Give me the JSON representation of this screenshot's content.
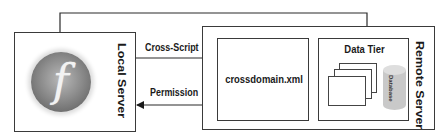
{
  "diagram": {
    "type": "architecture",
    "nodes": [
      {
        "id": "local_server",
        "label": "Local Server",
        "icon": "flash-player-icon"
      },
      {
        "id": "remote_server",
        "label": "Remote Server"
      },
      {
        "id": "crossdomain",
        "label": "crossdomain.xml",
        "parent": "remote_server"
      },
      {
        "id": "data_tier",
        "label": "Data Tier",
        "parent": "remote_server"
      },
      {
        "id": "database",
        "label": "Database",
        "parent": "data_tier"
      }
    ],
    "edges": [
      {
        "from": "local_server",
        "to": "crossdomain",
        "label": "Cross-Script"
      },
      {
        "from": "crossdomain",
        "to": "local_server",
        "label": "Permission"
      },
      {
        "from": "local_server",
        "to": "data_tier",
        "label": ""
      }
    ]
  },
  "local_server": {
    "label": "Local Server",
    "icon_glyph": "f"
  },
  "remote_server": {
    "label": "Remote Server"
  },
  "crossdomain": {
    "label": "crossdomain.xml"
  },
  "data_tier": {
    "label": "Data Tier",
    "database_label": "Database"
  },
  "edges": {
    "cross_script": "Cross-Script",
    "permission": "Permission"
  }
}
